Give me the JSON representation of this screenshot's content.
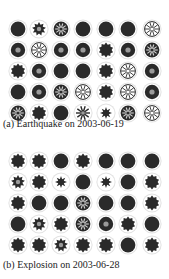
{
  "panels": [
    {
      "caption": "(a) Earthquake on 2003-06-19",
      "rows": [
        [
          "solid",
          "star-dark",
          "spoke-dark",
          "solid",
          "solid",
          "solid",
          "spoke-light"
        ],
        [
          "ring",
          "spoke-light",
          "ring",
          "ring",
          "spiky",
          "ring",
          "spoke-dark"
        ],
        [
          "spiky",
          "ring",
          "solid",
          "solid",
          "spiky",
          "spoke-light",
          "ring"
        ],
        [
          "solid",
          "ring",
          "spoke-dark",
          "spoke-light",
          "spiky",
          "spoke-light",
          "ring"
        ],
        [
          "spoke-dark",
          "spiky",
          "solid",
          "star-light",
          "star-small",
          "spoke-dark",
          "spoke-light"
        ]
      ]
    },
    {
      "caption": "(b) Explosion on 2003-06-28",
      "rows": [
        [
          "spiky",
          "spiky",
          "solid",
          "spiky",
          "solid",
          "solid",
          "solid"
        ],
        [
          "star-dark",
          "spiky",
          "star-small",
          "solid",
          "star-small",
          "solid",
          "spiky"
        ],
        [
          "spiky",
          "solid",
          "solid",
          "spoke-dark",
          "solid",
          "solid",
          "spiky"
        ],
        [
          "solid",
          "star-dark",
          "spiky",
          "spoke-dark",
          "ring",
          "spiky",
          "solid"
        ],
        [
          "spiky",
          "spiky",
          "star-dark",
          "spiky",
          "spiky",
          "solid",
          "spiky"
        ]
      ]
    }
  ],
  "colors": {
    "dark": "#2a2a2a",
    "light": "#ffffff",
    "halo": "#e2e2e2",
    "mid": "#9a9a9a"
  }
}
